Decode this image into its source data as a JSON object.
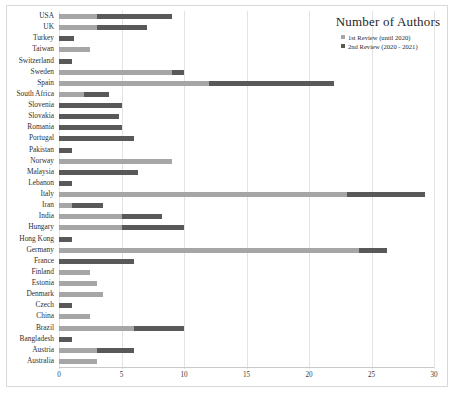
{
  "legend": {
    "title": "Number of Authors",
    "items": [
      {
        "label": "1st Review (until 2020)",
        "color": "#a6a6a6",
        "key": "s1"
      },
      {
        "label": "2nd Review (2020 - 2021)",
        "color": "#595959",
        "key": "s2"
      }
    ]
  },
  "chart_data": {
    "type": "bar",
    "orientation": "horizontal",
    "stacked": true,
    "title": "Number of Authors",
    "xlabel": "",
    "ylabel": "",
    "xlim": [
      0,
      30
    ],
    "xticks": [
      0,
      5,
      10,
      15,
      20,
      25,
      30
    ],
    "grid": true,
    "legend_position": "top-right",
    "categories": [
      "USA",
      "UK",
      "Turkey",
      "Taiwan",
      "Switzerland",
      "Sweden",
      "Spain",
      "South Africa",
      "Slovenia",
      "Slovakia",
      "Romania",
      "Portugal",
      "Pakistan",
      "Norway",
      "Malaysia",
      "Lebanon",
      "Italy",
      "Iran",
      "India",
      "Hungary",
      "Hong Kong",
      "Germany",
      "France",
      "Finland",
      "Estonia",
      "Denmark",
      "Czech",
      "China",
      "Brazil",
      "Bangladesh",
      "Austria",
      "Australia"
    ],
    "series": [
      {
        "name": "1st Review (until 2020)",
        "color": "#a6a6a6",
        "values": [
          3,
          3,
          0,
          2.5,
          0,
          9,
          12,
          2,
          0,
          0,
          0,
          0,
          0,
          9,
          0,
          0,
          23,
          1,
          5,
          5,
          0,
          24,
          0,
          2.5,
          3,
          3.5,
          0,
          2.5,
          6,
          0,
          3,
          3
        ]
      },
      {
        "name": "2nd Review (2020 - 2021)",
        "color": "#595959",
        "values": [
          6,
          4,
          1.2,
          0,
          1,
          1,
          10,
          2,
          5,
          4.8,
          5,
          6,
          1,
          0,
          6.3,
          1,
          6.3,
          2.5,
          3.2,
          5,
          1,
          2.2,
          6,
          0,
          0,
          0,
          1,
          0,
          4,
          1,
          3,
          0
        ]
      }
    ],
    "totals": [
      9,
      7,
      1.2,
      2.5,
      1,
      10,
      22,
      4,
      5,
      4.8,
      5,
      6,
      1,
      9,
      6.3,
      1,
      29.3,
      3.5,
      8.2,
      10,
      1,
      26.2,
      6,
      2.5,
      3,
      3.5,
      1,
      2.5,
      10,
      1,
      6,
      3
    ]
  }
}
